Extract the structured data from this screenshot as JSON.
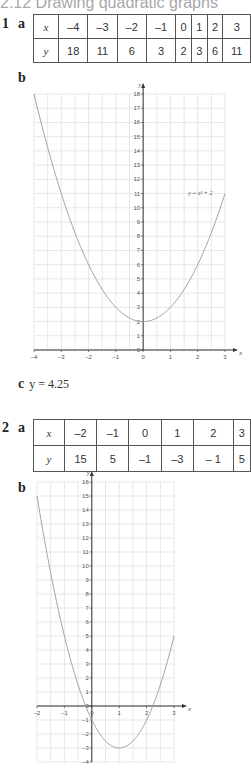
{
  "title": "2.12 Drawing quadratic graphs",
  "q1": {
    "number": "1",
    "part_a": "a",
    "table": {
      "x_header": "x",
      "y_header": "y",
      "x": [
        "–4",
        "–3",
        "–2",
        "–1",
        "0",
        "1",
        "2",
        "3"
      ],
      "y": [
        "18",
        "11",
        "6",
        "3",
        "2",
        "3",
        "6",
        "11"
      ]
    },
    "part_b": "b",
    "part_c": "c",
    "answer_c": "y = 4.25"
  },
  "q2": {
    "number": "2",
    "part_a": "a",
    "table": {
      "x_header": "x",
      "y_header": "y",
      "x": [
        "–2",
        "–1",
        "0",
        "1",
        "2",
        "3"
      ],
      "y": [
        "15",
        "5",
        "–1",
        "–3",
        "– 1",
        "5"
      ]
    },
    "part_b": "b"
  },
  "chart_data": [
    {
      "type": "line",
      "title": "",
      "equation_label": "y = x² + 2",
      "xlabel": "x",
      "ylabel": "y",
      "xlim": [
        -4,
        3
      ],
      "ylim": [
        0,
        18
      ],
      "x_ticks": [
        "-4",
        "-3",
        "-2",
        "-1",
        "0",
        "1",
        "2",
        "3"
      ],
      "y_ticks": [
        "0",
        "1",
        "2",
        "3",
        "4",
        "5",
        "6",
        "7",
        "8",
        "9",
        "10",
        "11",
        "12",
        "13",
        "14",
        "15",
        "16",
        "17",
        "18"
      ],
      "grid": true,
      "series": [
        {
          "name": "y = x² + 2",
          "x": [
            -4,
            -3,
            -2,
            -1,
            0,
            1,
            2,
            3
          ],
          "y": [
            18,
            11,
            6,
            3,
            2,
            3,
            6,
            11
          ]
        }
      ]
    },
    {
      "type": "line",
      "title": "",
      "xlabel": "x",
      "ylabel": "y",
      "xlim": [
        -2,
        3
      ],
      "ylim": [
        -4,
        16
      ],
      "x_ticks": [
        "-2",
        "-1",
        "0",
        "1",
        "2",
        "3"
      ],
      "y_ticks": [
        "-4",
        "-3",
        "-2",
        "-1",
        "0",
        "1",
        "2",
        "3",
        "4",
        "5",
        "6",
        "7",
        "8",
        "9",
        "10",
        "11",
        "12",
        "13",
        "14",
        "15",
        "16"
      ],
      "grid": true,
      "series": [
        {
          "name": "y = 4x² - 8x + 1",
          "x": [
            -2,
            -1,
            0,
            1,
            2,
            3
          ],
          "y": [
            15,
            5,
            -1,
            -3,
            -1,
            5
          ]
        }
      ]
    }
  ]
}
